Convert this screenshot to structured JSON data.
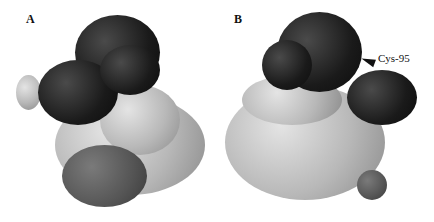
{
  "figure": {
    "panels": [
      {
        "label": "A"
      },
      {
        "label": "B"
      }
    ],
    "annotation": {
      "text": "Cys-95"
    }
  }
}
